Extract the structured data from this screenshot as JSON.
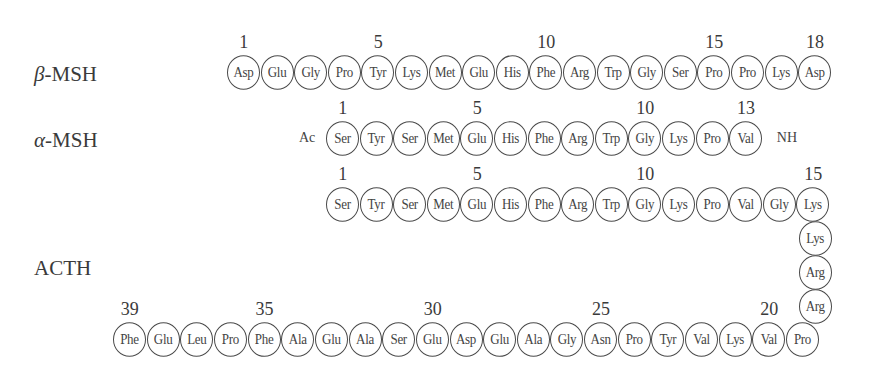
{
  "peptides": [
    {
      "id": "beta-msh",
      "greek": "β",
      "name": "-MSH",
      "label_pos": {
        "x": 34,
        "y": 62
      },
      "n_term": "",
      "c_term": "",
      "row": {
        "x0": 227,
        "cy": 73,
        "pitch": 33.6,
        "dir": 1
      },
      "residues": [
        "Asp",
        "Glu",
        "Gly",
        "Pro",
        "Tyr",
        "Lys",
        "Met",
        "Glu",
        "His",
        "Phe",
        "Arg",
        "Trp",
        "Gly",
        "Ser",
        "Pro",
        "Pro",
        "Lys",
        "Asp"
      ],
      "numbers": [
        {
          "index": 0,
          "n": "1"
        },
        {
          "index": 4,
          "n": "5"
        },
        {
          "index": 9,
          "n": "10"
        },
        {
          "index": 14,
          "n": "15"
        },
        {
          "index": 17,
          "n": "18"
        }
      ]
    },
    {
      "id": "alpha-msh",
      "greek": "α",
      "name": "-MSH",
      "label_pos": {
        "x": 34,
        "y": 128
      },
      "n_term": "Ac",
      "c_term": "NH",
      "row": {
        "x0": 326,
        "cy": 139,
        "pitch": 33.6,
        "dir": 1
      },
      "residues": [
        "Ser",
        "Tyr",
        "Ser",
        "Met",
        "Glu",
        "His",
        "Phe",
        "Arg",
        "Trp",
        "Gly",
        "Lys",
        "Pro",
        "Val"
      ],
      "numbers": [
        {
          "index": 0,
          "n": "1"
        },
        {
          "index": 4,
          "n": "5"
        },
        {
          "index": 9,
          "n": "10"
        },
        {
          "index": 12,
          "n": "13"
        }
      ]
    }
  ],
  "acth": {
    "greek": "",
    "name": "ACTH",
    "label_pos": {
      "x": 34,
      "y": 256
    },
    "top_row": {
      "x0": 326,
      "cy": 205,
      "pitch": 33.6,
      "residues": [
        "Ser",
        "Tyr",
        "Ser",
        "Met",
        "Glu",
        "His",
        "Phe",
        "Arg",
        "Trp",
        "Gly",
        "Lys",
        "Pro",
        "Val",
        "Gly",
        "Lys"
      ],
      "numbers": [
        {
          "index": 0,
          "n": "1"
        },
        {
          "index": 4,
          "n": "5"
        },
        {
          "index": 9,
          "n": "10"
        },
        {
          "index": 14,
          "n": "15"
        }
      ]
    },
    "column": {
      "cx": 815.5,
      "cys": [
        239,
        273,
        307
      ],
      "residues": [
        "Lys",
        "Arg",
        "Arg"
      ]
    },
    "bottom_row": {
      "x0": 113,
      "cy": 340,
      "pitch": 33.65,
      "residues": [
        "Phe",
        "Glu",
        "Leu",
        "Pro",
        "Phe",
        "Ala",
        "Glu",
        "Ala",
        "Ser",
        "Glu",
        "Asp",
        "Glu",
        "Ala",
        "Gly",
        "Asn",
        "Pro",
        "Tyr",
        "Val",
        "Lys",
        "Val",
        "Pro"
      ],
      "numbers": [
        {
          "index": 0,
          "n": "39"
        },
        {
          "index": 4,
          "n": "35"
        },
        {
          "index": 9,
          "n": "30"
        },
        {
          "index": 14,
          "n": "25"
        },
        {
          "index": 19,
          "n": "20"
        }
      ]
    }
  }
}
